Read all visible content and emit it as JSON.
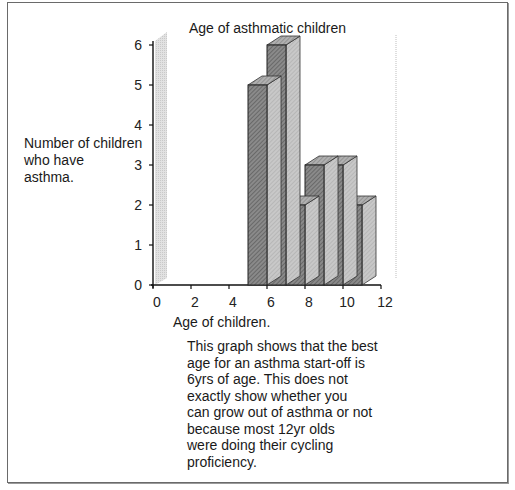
{
  "figure": {
    "title": "Age of asthmatic children",
    "ylabel_lines": [
      "Number of children",
      "who have",
      "asthma."
    ],
    "xlabel": "Age of children.",
    "caption_lines": [
      "This graph shows that the best",
      "age for an asthma start-off is",
      "6yrs of age. This does not",
      "exactly show whether you",
      "can grow out of asthma or not",
      "because most 12yr olds",
      "were doing their cycling",
      "proficiency."
    ]
  },
  "chart_data": {
    "type": "bar",
    "style": "3d histogram",
    "title": "Age of asthmatic children",
    "xlabel": "Age of children.",
    "ylabel": "Number of children who have asthma.",
    "x_ticks": [
      0,
      2,
      4,
      6,
      8,
      10,
      12
    ],
    "y_ticks": [
      0,
      1,
      2,
      3,
      4,
      5,
      6
    ],
    "xlim": [
      0,
      12
    ],
    "ylim": [
      0,
      6
    ],
    "bins": [
      {
        "x_start": 5,
        "x_end": 6,
        "value": 5
      },
      {
        "x_start": 6,
        "x_end": 7,
        "value": 6
      },
      {
        "x_start": 7,
        "x_end": 8,
        "value": 2
      },
      {
        "x_start": 8,
        "x_end": 9,
        "value": 3
      },
      {
        "x_start": 9,
        "x_end": 10,
        "value": 3
      },
      {
        "x_start": 10,
        "x_end": 11,
        "value": 2
      }
    ],
    "categories": [
      "5-6",
      "6-7",
      "7-8",
      "8-9",
      "9-10",
      "10-11"
    ],
    "values": [
      5,
      6,
      2,
      3,
      3,
      2
    ],
    "grid": false,
    "legend": null
  }
}
